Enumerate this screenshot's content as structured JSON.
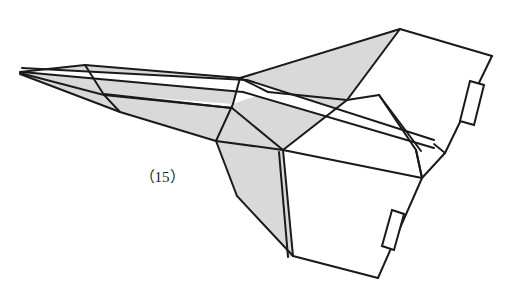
{
  "figure": {
    "caption": "（15）",
    "caption_number": "15",
    "kind": "line-drawing",
    "background_color": "#ffffff",
    "stroke_color": "#1a1a1a",
    "shade_color": "#d9d9d9",
    "canvas": {
      "width": 514,
      "height": 302
    },
    "parts": {
      "nose": "nose-apex",
      "left_wing": "left-swept-wing",
      "upper_wing": "upper-right-wing-panel",
      "lower_body": "lower-right-body-panel",
      "spine": "fuselage-spine",
      "tab_upper": "upper-wing-flap-tab",
      "tab_lower": "lower-body-flap-tab"
    }
  }
}
